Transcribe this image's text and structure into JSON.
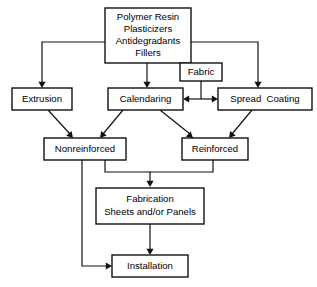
{
  "diagram": {
    "type": "process-flowchart",
    "colors": {
      "background": "#ffffff",
      "box_stroke": "#111111",
      "box_fill": "#ffffff",
      "text": "#000000",
      "connector": "#111111"
    },
    "nodes": [
      {
        "id": "materials",
        "lines": [
          "Polymer Resin",
          "Plasticizers",
          "Antidegradants",
          "Fillers"
        ],
        "x": 105,
        "y": 8,
        "w": 86,
        "h": 55
      },
      {
        "id": "fabric",
        "lines": [
          "Fabric"
        ],
        "x": 180,
        "y": 63,
        "w": 42,
        "h": 18
      },
      {
        "id": "extrusion",
        "lines": [
          "Extrusion"
        ],
        "x": 12,
        "y": 88,
        "w": 60,
        "h": 22
      },
      {
        "id": "calendaring",
        "lines": [
          "Calendaring"
        ],
        "x": 108,
        "y": 88,
        "w": 75,
        "h": 22
      },
      {
        "id": "spread-coating",
        "lines": [
          "Spread  Coating"
        ],
        "x": 218,
        "y": 88,
        "w": 94,
        "h": 22
      },
      {
        "id": "nonreinforced",
        "lines": [
          "Nonreinforced"
        ],
        "x": 44,
        "y": 138,
        "w": 82,
        "h": 22
      },
      {
        "id": "reinforced",
        "lines": [
          "Reinforced"
        ],
        "x": 182,
        "y": 138,
        "w": 66,
        "h": 22
      },
      {
        "id": "fabrication",
        "lines": [
          "Fabrication",
          "Sheets and/or Panels"
        ],
        "x": 96,
        "y": 188,
        "w": 108,
        "h": 36
      },
      {
        "id": "installation",
        "lines": [
          "Installation"
        ],
        "x": 112,
        "y": 255,
        "w": 76,
        "h": 22
      }
    ],
    "connectors": [
      {
        "id": "materials-to-extrusion",
        "from": "materials",
        "to": "extrusion",
        "path": "M105,42 L42,42 L42,86",
        "arrow": "down",
        "tip_x": 42,
        "tip_y": 88
      },
      {
        "id": "materials-to-calendaring",
        "from": "materials",
        "to": "calendaring",
        "path": "M147,63 L147,86",
        "arrow": "down",
        "tip_x": 147,
        "tip_y": 88
      },
      {
        "id": "materials-to-spreadcoating",
        "from": "materials",
        "to": "spread-coating",
        "path": "M191,42 L258,42 L258,86",
        "arrow": "down",
        "tip_x": 258,
        "tip_y": 88
      },
      {
        "id": "fabric-trunk",
        "from": "fabric",
        "to": "junction",
        "path": "M201,81 L201,99",
        "arrow": "none",
        "tip_x": 0,
        "tip_y": 0
      },
      {
        "id": "fabric-to-calendaring",
        "from": "fabric",
        "to": "calendaring",
        "path": "M201,99 L187,99",
        "arrow": "left",
        "tip_x": 183,
        "tip_y": 99
      },
      {
        "id": "fabric-to-spreadcoating",
        "from": "fabric",
        "to": "spread-coating",
        "path": "M201,99 L214,99",
        "arrow": "right",
        "tip_x": 218,
        "tip_y": 99
      },
      {
        "id": "extrusion-to-nonreinforced",
        "from": "extrusion",
        "to": "nonreinforced",
        "path": "M48,110 L70,134",
        "arrow": "diag",
        "tip_x": 73,
        "tip_y": 138
      },
      {
        "id": "calendaring-to-nonreinforced",
        "from": "calendaring",
        "to": "nonreinforced",
        "path": "M123,110 L103,134",
        "arrow": "diag",
        "tip_x": 100,
        "tip_y": 138
      },
      {
        "id": "calendaring-to-reinforced",
        "from": "calendaring",
        "to": "reinforced",
        "path": "M160,110 L190,134",
        "arrow": "diag",
        "tip_x": 193,
        "tip_y": 138
      },
      {
        "id": "spreadcoating-to-reinforced",
        "from": "spread-coating",
        "to": "reinforced",
        "path": "M252,110 L232,134",
        "arrow": "diag",
        "tip_x": 229,
        "tip_y": 138
      },
      {
        "id": "nonreinforced-to-fabrication",
        "from": "nonreinforced",
        "to": "fabrication",
        "path": "M105,160 L105,172 L150,172 L150,184",
        "arrow": "down",
        "tip_x": 150,
        "tip_y": 187
      },
      {
        "id": "reinforced-to-fabrication",
        "from": "reinforced",
        "to": "fabrication",
        "path": "M213,160 L213,172 L150,172",
        "arrow": "none",
        "tip_x": 0,
        "tip_y": 0
      },
      {
        "id": "fabrication-to-installation",
        "from": "fabrication",
        "to": "installation",
        "path": "M150,224 L150,252",
        "arrow": "down",
        "tip_x": 150,
        "tip_y": 255
      },
      {
        "id": "nonreinforced-to-installation",
        "from": "nonreinforced",
        "to": "installation",
        "path": "M82,160 L82,266 L107,266",
        "arrow": "right",
        "tip_x": 112,
        "tip_y": 266
      }
    ]
  }
}
